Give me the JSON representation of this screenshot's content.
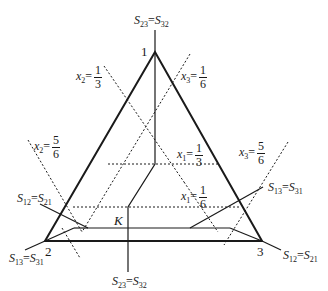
{
  "diagram": {
    "vertices": [
      {
        "id": "1",
        "label": "1"
      },
      {
        "id": "2",
        "label": "2"
      },
      {
        "id": "3",
        "label": "3"
      }
    ],
    "point_label": "K",
    "boundaries": {
      "top": {
        "s": "S",
        "a": "23",
        "eq": "=",
        "b": "32"
      },
      "bottom": {
        "s": "S",
        "a": "23",
        "eq": "=",
        "b": "32"
      },
      "left_upper": {
        "s": "S",
        "a": "12",
        "eq": "=",
        "b": "21"
      },
      "left_lower": {
        "s": "S",
        "a": "13",
        "eq": "=",
        "b": "31"
      },
      "right_upper": {
        "s": "S",
        "a": "13",
        "eq": "=",
        "b": "31"
      },
      "right_lower": {
        "s": "S",
        "a": "12",
        "eq": "=",
        "b": "21"
      }
    },
    "isolines": [
      {
        "var": "x",
        "sub": "2",
        "num": "1",
        "den": "3"
      },
      {
        "var": "x",
        "sub": "3",
        "num": "1",
        "den": "6"
      },
      {
        "var": "x",
        "sub": "2",
        "num": "5",
        "den": "6"
      },
      {
        "var": "x",
        "sub": "1",
        "num": "1",
        "den": "3"
      },
      {
        "var": "x",
        "sub": "3",
        "num": "5",
        "den": "6"
      },
      {
        "var": "x",
        "sub": "1",
        "num": "1",
        "den": "6"
      }
    ],
    "colors": {
      "ink": "#1a1a1a",
      "background": "#ffffff"
    }
  }
}
